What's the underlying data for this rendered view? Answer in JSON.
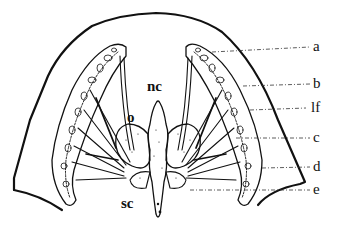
{
  "diagram": {
    "type": "anatomical-cross-section",
    "colors": {
      "ink": "#111111",
      "background": "#ffffff"
    },
    "center_labels": [
      {
        "id": "nc",
        "text": "nc",
        "x": 147,
        "y": 79
      },
      {
        "id": "o",
        "text": "o",
        "x": 127,
        "y": 110
      },
      {
        "id": "sc",
        "text": "sc",
        "x": 121,
        "y": 196
      }
    ],
    "side_labels": [
      {
        "id": "a",
        "text": "a",
        "x": 313,
        "y": 39,
        "leader_from": [
          42,
          52
        ]
      },
      {
        "id": "b",
        "text": "b",
        "x": 313,
        "y": 76,
        "leader_from": [
          243,
          86
        ]
      },
      {
        "id": "lf",
        "text": "lf",
        "x": 311,
        "y": 100,
        "leader_from": [
          250,
          110
        ]
      },
      {
        "id": "c",
        "text": "c",
        "x": 313,
        "y": 130,
        "leader_from": [
          236,
          138
        ]
      },
      {
        "id": "d",
        "text": "d",
        "x": 313,
        "y": 159,
        "leader_from": [
          262,
          168
        ]
      },
      {
        "id": "e",
        "text": "e",
        "x": 313,
        "y": 182,
        "leader_from": [
          190,
          190
        ]
      }
    ]
  }
}
